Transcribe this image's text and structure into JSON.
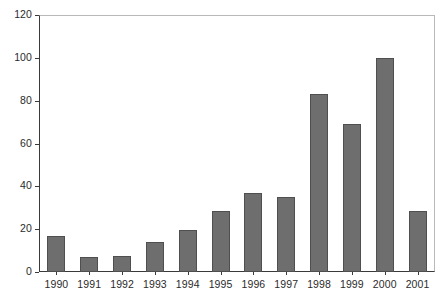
{
  "chart_data": {
    "type": "bar",
    "title": "",
    "subtitle": "",
    "xlabel": "",
    "ylabel": "",
    "categories": [
      "1990",
      "1991",
      "1992",
      "1993",
      "1994",
      "1995",
      "1996",
      "1997",
      "1998",
      "1999",
      "2000",
      "2001"
    ],
    "values": [
      17,
      7,
      7.5,
      14,
      19.5,
      28.5,
      37,
      35,
      83,
      69,
      100,
      28.5
    ],
    "ylim": [
      0,
      120
    ],
    "ytick_labels": [
      "0",
      "20",
      "40",
      "60",
      "80",
      "100",
      "120"
    ],
    "ytick_values": [
      0,
      20,
      40,
      60,
      80,
      100,
      120
    ],
    "grid": false,
    "legend": false,
    "legend_position": "none",
    "annotations": [],
    "colors": {
      "bar_fill": "#6e6e6e",
      "bar_stroke": "#4f4f4f",
      "axis": "#3a3a3a",
      "frame_light": "#b9b9b9",
      "text": "#2b2b2b",
      "background": "#ffffff"
    }
  }
}
